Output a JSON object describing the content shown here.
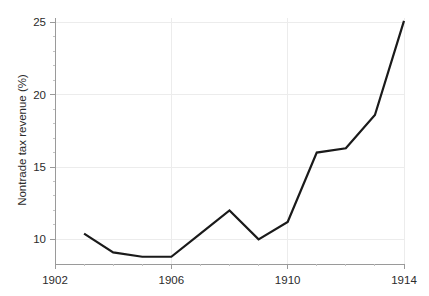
{
  "chart_data": {
    "type": "line",
    "title": "",
    "subtitle": "",
    "xlabel": "",
    "ylabel": "Nontrade tax revenue (%)",
    "xlim": [
      1902,
      1914
    ],
    "ylim": [
      8.3,
      25.3
    ],
    "grid": true,
    "legend": null,
    "x": [
      1903,
      1904,
      1905,
      1906,
      1907,
      1908,
      1909,
      1910,
      1911,
      1912,
      1913,
      1914
    ],
    "values": [
      10.4,
      9.1,
      8.8,
      8.8,
      10.4,
      12.0,
      10.0,
      11.2,
      16.0,
      16.3,
      18.6,
      25.1
    ],
    "series": [
      {
        "name": "Nontrade tax revenue",
        "color": "#1a1a1a",
        "values": [
          10.4,
          9.1,
          8.8,
          8.8,
          10.4,
          12.0,
          10.0,
          11.2,
          16.0,
          16.3,
          18.6,
          25.1
        ]
      }
    ],
    "x_ticks": [
      {
        "value": 1902,
        "label": "1902"
      },
      {
        "value": 1906,
        "label": "1906"
      },
      {
        "value": 1910,
        "label": "1910"
      },
      {
        "value": 1914,
        "label": "1914"
      }
    ],
    "x_minor_ticks": [
      1903,
      1904,
      1905,
      1907,
      1908,
      1909,
      1911,
      1912,
      1913
    ],
    "y_ticks": [
      {
        "value": 10,
        "label": "10"
      },
      {
        "value": 15,
        "label": "15"
      },
      {
        "value": 20,
        "label": "20"
      },
      {
        "value": 25,
        "label": "25"
      }
    ],
    "y_minor_ticks": [
      11,
      12,
      13,
      14,
      16,
      17,
      18,
      19,
      21,
      22,
      23,
      24
    ],
    "colors": {
      "line": "#1a1a1a",
      "grid": "#ececec",
      "axis": "#9a9a9a",
      "text": "#2b2b2b",
      "background": "#ffffff"
    }
  }
}
